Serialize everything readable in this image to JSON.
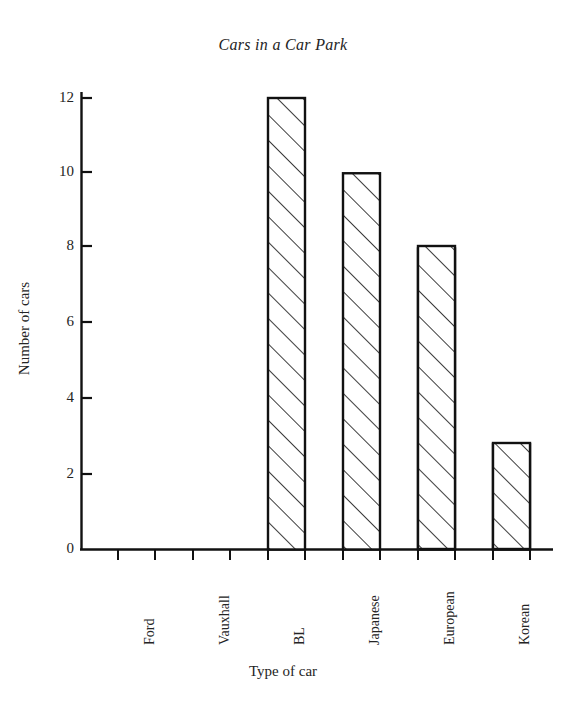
{
  "chart_data": {
    "type": "bar",
    "title": "Cars in a Car Park",
    "xlabel": "Type of car",
    "ylabel": "Number of cars",
    "categories": [
      "Ford",
      "Vauxhall",
      "BL",
      "Japanese",
      "European",
      "Korean"
    ],
    "values": [
      10,
      7.2,
      12,
      10,
      8,
      2.8
    ],
    "ylim": [
      0,
      12.8
    ],
    "yticks": [
      0,
      2,
      4,
      6,
      8,
      10,
      12
    ],
    "ytick_labels": [
      "0",
      "2",
      "4",
      "6",
      "8",
      "10",
      "12"
    ],
    "grid": false,
    "legend": null,
    "bar_style": {
      "fill": "#ffffff",
      "edge_color": "#111111",
      "hatch": "diagonal-up-right"
    },
    "axis_color": "#111111",
    "background": "#ffffff"
  },
  "axis": {
    "y_tick_0": "0",
    "y_tick_1": "2",
    "y_tick_2": "4",
    "y_tick_3": "6",
    "y_tick_4": "8",
    "y_tick_5": "10",
    "y_tick_6": "12"
  },
  "categories": {
    "c0": "Ford",
    "c1": "Vauxhall",
    "c2": "BL",
    "c3": "Japanese",
    "c4": "European",
    "c5": "Korean"
  }
}
